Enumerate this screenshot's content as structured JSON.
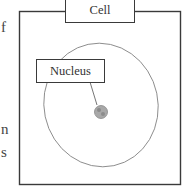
{
  "left_text_fragments": [
    {
      "text": "f",
      "x": 1,
      "y": 21
    },
    {
      "text": "n",
      "x": 1,
      "y": 124
    },
    {
      "text": "s",
      "x": 1,
      "y": 147
    }
  ],
  "diagram": {
    "title_label": "Cell",
    "nucleus_label": "Nucleus",
    "colors": {
      "stroke": "#3a3a3a",
      "membrane": "#8a8a8a",
      "nucleolus": "#9a9a9a"
    }
  }
}
